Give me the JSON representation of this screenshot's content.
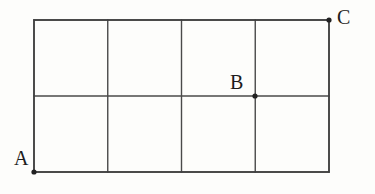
{
  "figure": {
    "type": "geometry-grid-diagram",
    "background_color": "#fdfdfb",
    "line_color": "#4a4a4a",
    "label_color": "#1c1c1c",
    "dot_color": "#222222",
    "grid": {
      "columns": 4,
      "rows": 2,
      "left": 34,
      "top": 20,
      "right": 329,
      "bottom": 172,
      "cell_width": 73.75,
      "cell_height": 76,
      "vertical_line_x": [
        34,
        107.75,
        181.5,
        255.25,
        329
      ],
      "horizontal_line_y": [
        20,
        96,
        172
      ]
    },
    "points": [
      {
        "id": "A",
        "label": "A",
        "x": 34,
        "y": 172,
        "position": "bottom-left-corner"
      },
      {
        "id": "B",
        "label": "B",
        "x": 255,
        "y": 96,
        "position": "midline-third-vertical-intersection"
      },
      {
        "id": "C",
        "label": "C",
        "x": 329,
        "y": 20,
        "position": "top-right-corner"
      }
    ]
  },
  "chart_data": {
    "type": "table",
    "title": "",
    "xlabel": "",
    "ylabel": "",
    "categories": [
      "A",
      "B",
      "C"
    ],
    "values": [
      0,
      0,
      0
    ],
    "grid": true,
    "legend": "none"
  }
}
